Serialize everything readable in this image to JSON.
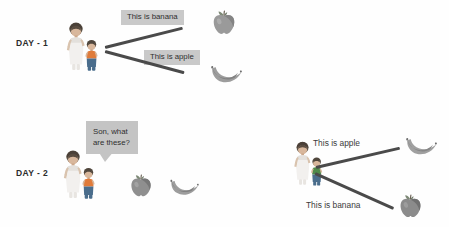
{
  "panels": [
    {
      "id": "day-1",
      "label": "DAY - 1",
      "speaker": "mother",
      "captions": [
        {
          "text": "This is banana",
          "style": "box",
          "points_to": "apple"
        },
        {
          "text": "This is apple",
          "style": "box",
          "points_to": "banana"
        }
      ],
      "fruits": [
        "apple",
        "banana"
      ]
    },
    {
      "id": "day-2",
      "label": "DAY - 2",
      "question": "Son, what\nare these?",
      "fruits": [
        "apple",
        "banana"
      ],
      "answers": [
        {
          "text": "This is apple",
          "style": "plain",
          "points_to": "banana"
        },
        {
          "text": "This is banana",
          "style": "plain",
          "points_to": "apple"
        }
      ]
    }
  ],
  "colors": {
    "caption_box_bg": "#c9c9c9",
    "bubble_bg": "#c4c4c4",
    "line": "#4a4a4a",
    "text": "#2e2e2e",
    "day_text": "#2b2b2b",
    "page_bg": "#fefefe"
  },
  "icons": {
    "apple": "apple-icon",
    "banana": "banana-icon",
    "family": "mother-and-child-icon"
  }
}
